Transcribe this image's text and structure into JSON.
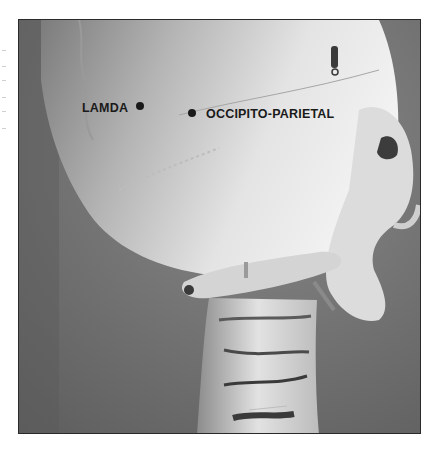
{
  "figure": {
    "labels": [
      {
        "id": "lamda",
        "text": "LAMDA"
      },
      {
        "id": "occipito-parietal",
        "text": "OCCIPITO-PARIETAL"
      }
    ],
    "marker_color": "#1a1a1a",
    "label_color": "#1a1a1a",
    "background_color": "#6f6f6f",
    "bone_color": "#e6e6e6"
  }
}
